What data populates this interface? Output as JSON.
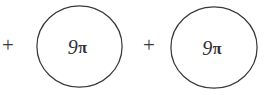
{
  "expression": {
    "description": "9π + 9π",
    "stroke_color": "#39393c",
    "text_color": "#2e2e31",
    "background_color": "#ffffff",
    "operators": [
      {
        "symbol": "+",
        "name": "plus-operator-left"
      },
      {
        "symbol": "+",
        "name": "plus-operator-middle"
      }
    ],
    "terms": [
      {
        "coefficient": "9",
        "symbol": "π",
        "full_label": "9π"
      },
      {
        "coefficient": "9",
        "symbol": "π",
        "full_label": "9π"
      }
    ]
  }
}
